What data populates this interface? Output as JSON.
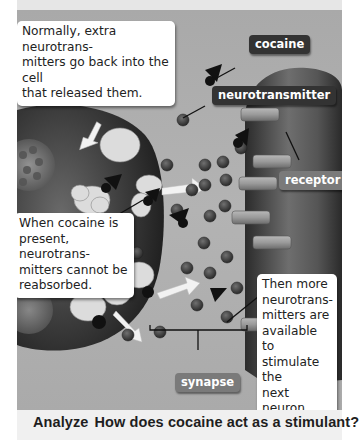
{
  "figure": {
    "callouts": {
      "normally": "Normally, extra neurotrans-mitters go back into the cell that released them.",
      "normally_lines": [
        "Normally, extra neurotrans-",
        "mitters go back into the cell",
        "that released them."
      ],
      "cocaine_present_lines": [
        "When cocaine is",
        "present, neurotrans-",
        "mitters cannot be",
        "reabsorbed."
      ],
      "then_more_lines": [
        "Then more",
        "neurotrans-",
        "mitters are",
        "available to",
        "stimulate the",
        "next neuron."
      ]
    },
    "labels": {
      "cocaine": "cocaine",
      "neurotransmitter": "neurotransmitter",
      "receptor": "receptor",
      "synapse": "synapse"
    },
    "icons": {
      "neurotransmitter": "small-dark-sphere",
      "cocaine": "black-cone-molecule",
      "receptor": "cylinder",
      "arrow": "white-arrow"
    },
    "colors": {
      "background": "#b0b0b0",
      "neuron_dark": "#2a2a2a",
      "label_dark": "#333333",
      "label_mid": "#7a7a7a",
      "callout_bg": "#ffffff"
    }
  },
  "caption": {
    "keyword": "Analyze",
    "question": "How does cocaine act as a stimulant?"
  }
}
